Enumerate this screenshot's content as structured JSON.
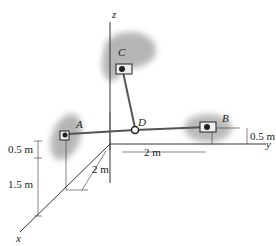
{
  "diagram": {
    "axes": {
      "x": "x",
      "y": "y",
      "z": "z"
    },
    "points": {
      "A": "A",
      "B": "B",
      "C": "C",
      "D": "D"
    },
    "dimensions": {
      "a_height_top": "0.5 m",
      "a_height_bottom": "1.5 m",
      "x_offset": "2 m",
      "y_offset": "2 m",
      "b_height": "0.5 m"
    },
    "colors": {
      "wall": "#8a8a8a",
      "line": "#333333",
      "cable": "#555555"
    }
  }
}
